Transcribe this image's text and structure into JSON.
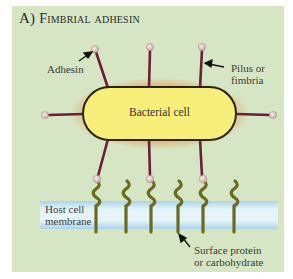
{
  "figure": {
    "panel_letter": "A)",
    "title": "Fimbrial adhesin",
    "colors": {
      "background": "#d6e6c4",
      "cell_fill": "#f8ee7a",
      "cell_glow": "#e8a060",
      "cell_outline": "#2a2410",
      "pilus": "#6a1e38",
      "adhesin": "#e6d0cc",
      "receptor": "#6b6a1e",
      "membrane": "#cfe6f0"
    }
  },
  "labels": {
    "adhesin": "Adhesin",
    "pilus_line1": "Pilus or",
    "pilus_line2": "fimbria",
    "bacterial_cell": "Bacterial cell",
    "membrane_line1": "Host cell",
    "membrane_line2": "membrane",
    "surface_line1": "Surface protein",
    "surface_line2": "or carbohydrate"
  }
}
